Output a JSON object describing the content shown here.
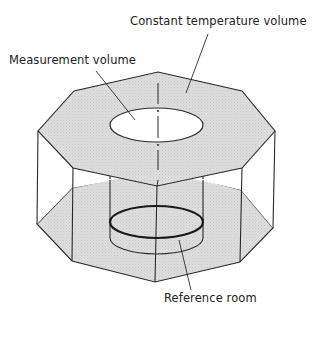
{
  "diagram": {
    "type": "isometric schematic",
    "labels": {
      "constant_temperature_volume": "Constant temperature volume",
      "measurement_volume": "Measurement volume",
      "reference_room": "Reference room"
    },
    "colors": {
      "line": "#2a2a2a",
      "fill_shaded": "#d9d9d9",
      "background": "#ffffff"
    },
    "components": [
      {
        "id": "top-octagon",
        "label_ref": "constant_temperature_volume",
        "shaded": true
      },
      {
        "id": "bottom-octagon",
        "shaded": true
      },
      {
        "id": "cylinder",
        "label_ref": "measurement_volume",
        "edges": "dashed"
      },
      {
        "id": "reference-ring",
        "label_ref": "reference_room",
        "style": "thick"
      }
    ]
  }
}
